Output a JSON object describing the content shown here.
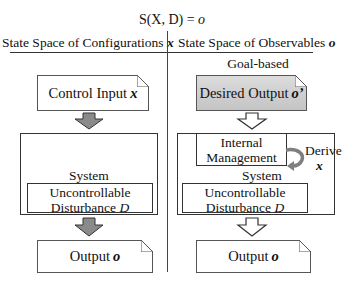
{
  "title": {
    "prefix": "S(X, D) = ",
    "var": "o"
  },
  "headers": {
    "left": {
      "text": "State Space of Configurations ",
      "var": "x"
    },
    "right": {
      "text": "State Space of Observables ",
      "var": "o"
    }
  },
  "left_column": {
    "input_box": {
      "text": "Control Input ",
      "var": "x"
    },
    "system_label": "System",
    "disturbance": {
      "line1": "Uncontrollable",
      "line2": "Disturbance ",
      "var": "D"
    },
    "output_box": {
      "text": "Output ",
      "var": "o"
    },
    "arrow_style": "filled-gray"
  },
  "right_column": {
    "caption": "Goal-based",
    "input_box": {
      "text": "Desired Output ",
      "var": "o’"
    },
    "internal_box": {
      "line1": "Internal",
      "line2": "Management"
    },
    "derive": {
      "label": "Derive",
      "var": "x"
    },
    "system_label": "System",
    "disturbance": {
      "line1": "Uncontrollable",
      "line2": "Disturbance ",
      "var": "D"
    },
    "output_box": {
      "text": "Output ",
      "var": "o"
    },
    "arrow_style": "outline-white"
  },
  "colors": {
    "arrow_fill_left": "#8a8a8a",
    "desired_output_fill": "#cfcfcf",
    "derive_arrow": "#7f7f7f",
    "line": "#333333"
  }
}
